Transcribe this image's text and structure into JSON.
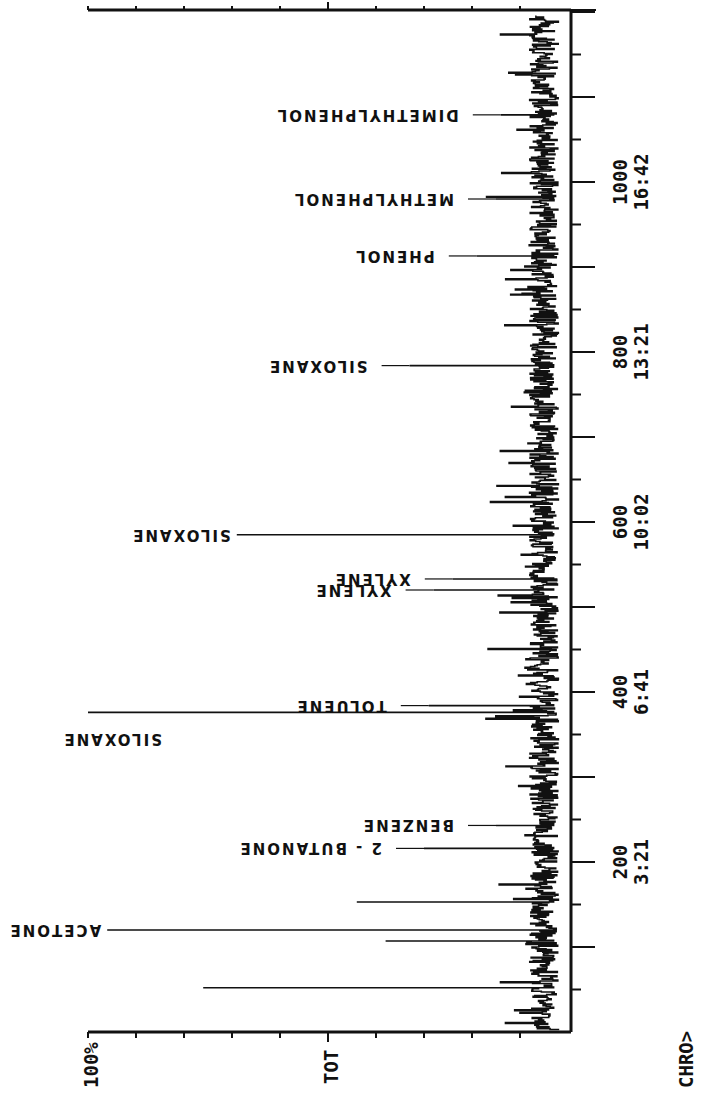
{
  "chart_data": {
    "type": "line",
    "title": "CHRO>",
    "trace_label": "TOT",
    "intensity_max_label": "100%",
    "xlabel": "Scan number / retention time (min:sec)",
    "ylabel": "Relative intensity (%)",
    "ylim": [
      0,
      100
    ],
    "xlim": [
      0,
      1200
    ],
    "orientation": "rotated 90° (time axis vertical, intensity horizontal)",
    "x_ticks": [
      {
        "scan": "200",
        "time": "3:21"
      },
      {
        "scan": "400",
        "time": "6:41"
      },
      {
        "scan": "600",
        "time": "10:02"
      },
      {
        "scan": "800",
        "time": "13:21"
      },
      {
        "scan": "1000",
        "time": "16:42"
      }
    ],
    "peaks": [
      {
        "scan": 52,
        "intensity": 76,
        "label": ""
      },
      {
        "scan": 107,
        "intensity": 38,
        "label": ""
      },
      {
        "scan": 120,
        "intensity": 96,
        "label": "ACETONE"
      },
      {
        "scan": 153,
        "intensity": 44,
        "label": ""
      },
      {
        "scan": 216,
        "intensity": 30,
        "label": "2 - BUTANONE"
      },
      {
        "scan": 243,
        "intensity": 15,
        "label": "BENZENE"
      },
      {
        "scan": 376,
        "intensity": 100,
        "label": "SILOXANE"
      },
      {
        "scan": 384,
        "intensity": 29,
        "label": "TOLUENE"
      },
      {
        "scan": 520,
        "intensity": 28,
        "label": "XYLENE"
      },
      {
        "scan": 533,
        "intensity": 24,
        "label": "XYLENE"
      },
      {
        "scan": 585,
        "intensity": 69,
        "label": "SILOXANE"
      },
      {
        "scan": 784,
        "intensity": 33,
        "label": "SILOXANE"
      },
      {
        "scan": 913,
        "intensity": 19,
        "label": "PHENOL"
      },
      {
        "scan": 980,
        "intensity": 15,
        "label": "METHYLPHENOL"
      },
      {
        "scan": 1079,
        "intensity": 14,
        "label": "DIMETHYLPHENOL"
      }
    ],
    "grid": false,
    "legend": "none"
  }
}
